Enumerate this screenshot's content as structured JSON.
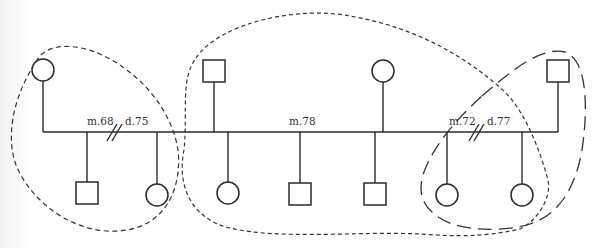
{
  "diagram": {
    "type": "genogram",
    "labels": {
      "first_marriage": "m.68",
      "first_divorce": "d.75",
      "second_marriage": "m.78",
      "third_marriage": "m.72",
      "third_divorce": "d.77"
    },
    "parents": [
      {
        "id": "p1",
        "sex": "female"
      },
      {
        "id": "p2",
        "sex": "male"
      },
      {
        "id": "p3",
        "sex": "female"
      },
      {
        "id": "p4",
        "sex": "male"
      }
    ],
    "children": [
      {
        "id": "c1",
        "sex": "male",
        "of": "m.68"
      },
      {
        "id": "c2",
        "sex": "female",
        "of": "m.68"
      },
      {
        "id": "c3",
        "sex": "female",
        "of": "m.78"
      },
      {
        "id": "c4",
        "sex": "male",
        "of": "m.78"
      },
      {
        "id": "c5",
        "sex": "male",
        "of": "m.78"
      },
      {
        "id": "c6",
        "sex": "female",
        "of": "m.72"
      },
      {
        "id": "c7",
        "sex": "female",
        "of": "m.72"
      }
    ],
    "household_boundaries": [
      {
        "id": "household-1",
        "style": "short-dash"
      },
      {
        "id": "household-2",
        "style": "short-dash"
      },
      {
        "id": "household-3",
        "style": "long-dash"
      }
    ]
  }
}
